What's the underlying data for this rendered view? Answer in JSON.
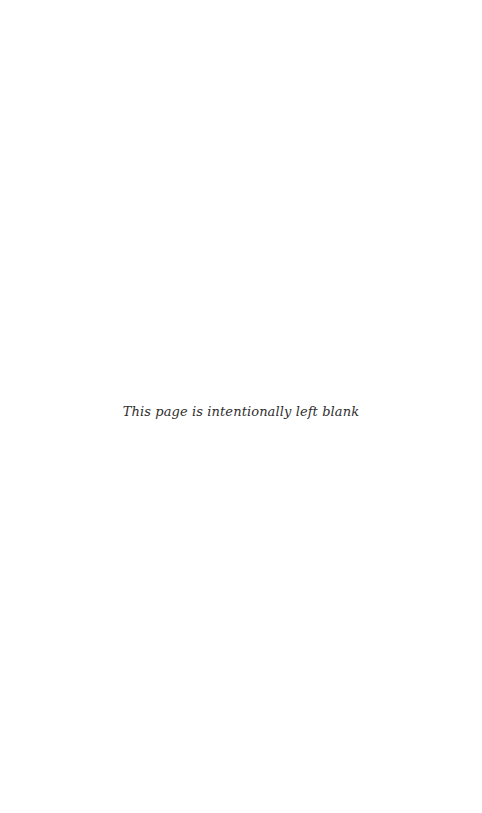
{
  "page": {
    "notice": "This page is intentionally left blank",
    "text_color": "#2e2e2e",
    "background_color": "#ffffff"
  }
}
